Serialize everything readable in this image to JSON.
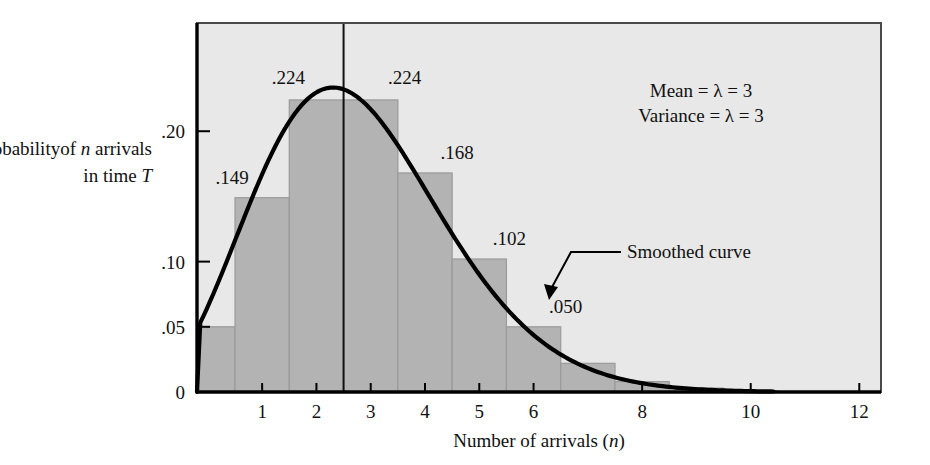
{
  "figure": {
    "background_color": "#ffffff",
    "plot_background_color": "#e8e8e8",
    "bar_fill_color": "#b3b3b3",
    "bar_edge_color": "#9a9a9a",
    "curve_color": "#000000",
    "frame_color": "#3a3a3a",
    "axis_color": "#000000"
  },
  "ylabel": {
    "line1_a": "Probability",
    "line1_b": "of ",
    "line1_c": "n",
    "line1_d": " arrivals",
    "line2_a": "in time ",
    "line2_b": "T"
  },
  "xlabel": {
    "a": "Number of arrivals (",
    "b": "n",
    "c": ")"
  },
  "annotations": {
    "mean": "Mean = λ = 3",
    "variance": "Variance = λ = 3",
    "smoothed_curve": "Smoothed curve"
  },
  "chart_data": {
    "type": "bar",
    "title": "",
    "subtitle": "",
    "xlabel": "Number of arrivals (n)",
    "ylabel": "Probability of n arrivals in time T",
    "categories": [
      0,
      1,
      2,
      3,
      4,
      5,
      6,
      7,
      8,
      9,
      10,
      11
    ],
    "values": [
      0.05,
      0.149,
      0.224,
      0.224,
      0.168,
      0.102,
      0.05,
      0.022,
      0.008,
      0.003,
      0.001,
      0.0
    ],
    "bar_labels": [
      {
        "n": 1,
        "text": ".149"
      },
      {
        "n": 2,
        "text": ".224"
      },
      {
        "n": 3,
        "text": ".224"
      },
      {
        "n": 4,
        "text": ".168"
      },
      {
        "n": 5,
        "text": ".102"
      },
      {
        "n": 6,
        "text": ".050"
      }
    ],
    "xtick_values": [
      1,
      2,
      3,
      4,
      5,
      6,
      8,
      10,
      12
    ],
    "xtick_labels": [
      "1",
      "2",
      "3",
      "4",
      "5",
      "6",
      "8",
      "10",
      "12"
    ],
    "ytick_values": [
      0,
      0.05,
      0.1,
      0.2
    ],
    "ytick_labels": [
      "0",
      ".05",
      ".10",
      ".20"
    ],
    "xlim": [
      -0.2,
      12.4
    ],
    "ylim": [
      0,
      0.283
    ],
    "grid": false,
    "legend": "none",
    "lambda": 3,
    "mean": 3,
    "variance": 3,
    "series": [
      {
        "name": "Poisson pmf (histogram)",
        "values": [
          0.05,
          0.149,
          0.224,
          0.224,
          0.168,
          0.102,
          0.05,
          0.022,
          0.008,
          0.003,
          0.001,
          0.0
        ]
      },
      {
        "name": "Smoothed curve",
        "type": "line",
        "note": "continuous smooth envelope through the Poisson probabilities, peaking near n = 2.3 at about 0.225"
      }
    ],
    "mean_line": {
      "x": 2.5,
      "label": "Mean = λ = 3"
    }
  }
}
